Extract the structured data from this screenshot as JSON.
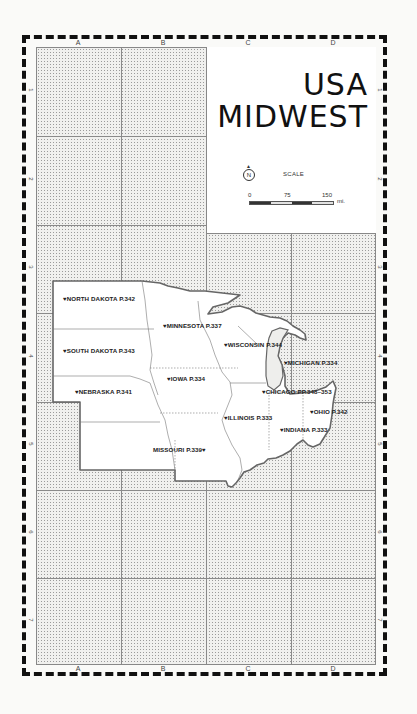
{
  "title": {
    "line1": "USA",
    "line2": "MIDWEST"
  },
  "legend": {
    "compass_icon": "north-arrow-icon",
    "compass_letter": "N",
    "scale_label": "SCALE",
    "scale_ticks": [
      "0",
      "75",
      "150"
    ],
    "scale_unit": "mi."
  },
  "grid": {
    "columns": [
      "A",
      "B",
      "C",
      "D"
    ],
    "rows": [
      "1",
      "2",
      "3",
      "4",
      "5",
      "6",
      "7"
    ]
  },
  "pin_glyph": "♥",
  "states": [
    {
      "name": "NORTH DAKOTA P.342",
      "x": 63,
      "y": 295,
      "pin": "left"
    },
    {
      "name": "MINNESOTA P.337",
      "x": 163,
      "y": 322,
      "pin": "left"
    },
    {
      "name": "SOUTH DAKOTA P.343",
      "x": 63,
      "y": 347,
      "pin": "left"
    },
    {
      "name": "WISCONSIN P.344",
      "x": 224,
      "y": 341,
      "pin": "left"
    },
    {
      "name": "MICHIGAN P.334",
      "x": 284,
      "y": 359,
      "pin": "left"
    },
    {
      "name": "IOWA P.334",
      "x": 167,
      "y": 375,
      "pin": "left"
    },
    {
      "name": "NEBRASKA P.341",
      "x": 75,
      "y": 388,
      "pin": "left"
    },
    {
      "name": "CHICAGO PP.348–353",
      "x": 262,
      "y": 388,
      "pin": "left"
    },
    {
      "name": "OHIO P.342",
      "x": 310,
      "y": 408,
      "pin": "left"
    },
    {
      "name": "ILLINOIS P.333",
      "x": 224,
      "y": 414,
      "pin": "left"
    },
    {
      "name": "INDIANA P.333",
      "x": 280,
      "y": 426,
      "pin": "left"
    },
    {
      "name": "MISSOURI P.339",
      "x": 153,
      "y": 446,
      "pin": "right"
    }
  ]
}
